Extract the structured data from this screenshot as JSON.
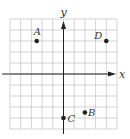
{
  "chart_data": {
    "type": "scatter",
    "title": "",
    "xlabel": "x",
    "ylabel": "y",
    "xlim": [
      -5,
      5
    ],
    "ylim": [
      -5,
      5
    ],
    "grid": true,
    "grid_step": 1,
    "legend": null,
    "points": [
      {
        "label": "A",
        "x": -2.5,
        "y": 3
      },
      {
        "label": "B",
        "x": 2,
        "y": -3.5
      },
      {
        "label": "C",
        "x": 0,
        "y": -4
      },
      {
        "label": "D",
        "x": 4,
        "y": 3
      }
    ]
  },
  "colors": {
    "grid": "#c8c8c8",
    "axis": "#222222",
    "point": "#222222",
    "label": "#333333"
  }
}
